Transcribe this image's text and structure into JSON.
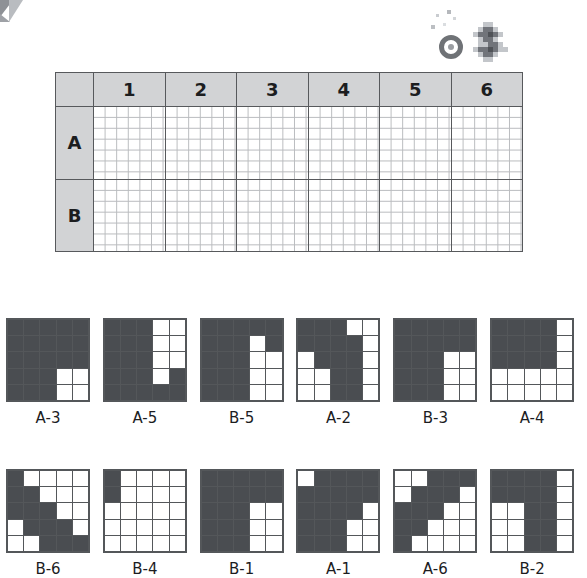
{
  "worksheet": {
    "column_headers": [
      "1",
      "2",
      "3",
      "4",
      "5",
      "6"
    ],
    "row_headers": [
      "A",
      "B"
    ],
    "header_fill": "#d2d3d5",
    "border_color": "#57595c",
    "inner_grid_color": "#b9bbbe"
  },
  "decor": {
    "corner_mark": "grey-wedge-mark",
    "ring_icon": "ring-ornament",
    "pixel_blob": "pixel-blob-ornament"
  },
  "patterns": {
    "on_color": "#4a4d51",
    "off_color": "#ffffff",
    "grid_size": 5,
    "legend": "1 = filled cell, 0 = empty cell",
    "rows": [
      [
        {
          "label": "A-3",
          "cells": [
            [
              1,
              1,
              1,
              1,
              1
            ],
            [
              1,
              1,
              1,
              1,
              1
            ],
            [
              1,
              1,
              1,
              1,
              1
            ],
            [
              1,
              1,
              1,
              0,
              0
            ],
            [
              1,
              1,
              1,
              0,
              0
            ]
          ]
        },
        {
          "label": "A-5",
          "cells": [
            [
              1,
              1,
              1,
              0,
              0
            ],
            [
              1,
              1,
              1,
              0,
              0
            ],
            [
              1,
              1,
              1,
              0,
              0
            ],
            [
              1,
              1,
              1,
              0,
              1
            ],
            [
              1,
              1,
              1,
              1,
              1
            ]
          ]
        },
        {
          "label": "B-5",
          "cells": [
            [
              1,
              1,
              1,
              1,
              1
            ],
            [
              1,
              1,
              1,
              0,
              1
            ],
            [
              1,
              1,
              1,
              0,
              0
            ],
            [
              1,
              1,
              1,
              0,
              0
            ],
            [
              1,
              1,
              1,
              0,
              0
            ]
          ]
        },
        {
          "label": "A-2",
          "cells": [
            [
              1,
              1,
              1,
              0,
              0
            ],
            [
              1,
              1,
              1,
              1,
              0
            ],
            [
              0,
              1,
              1,
              1,
              0
            ],
            [
              0,
              0,
              1,
              1,
              0
            ],
            [
              0,
              0,
              1,
              1,
              0
            ]
          ]
        },
        {
          "label": "B-3",
          "cells": [
            [
              1,
              1,
              1,
              1,
              1
            ],
            [
              1,
              1,
              1,
              1,
              1
            ],
            [
              1,
              1,
              1,
              0,
              0
            ],
            [
              1,
              1,
              1,
              0,
              0
            ],
            [
              1,
              1,
              1,
              0,
              0
            ]
          ]
        },
        {
          "label": "A-4",
          "cells": [
            [
              1,
              1,
              1,
              1,
              0
            ],
            [
              1,
              1,
              1,
              1,
              0
            ],
            [
              1,
              1,
              1,
              1,
              0
            ],
            [
              0,
              0,
              0,
              0,
              0
            ],
            [
              0,
              0,
              0,
              0,
              0
            ]
          ]
        }
      ],
      [
        {
          "label": "B-6",
          "cells": [
            [
              1,
              0,
              0,
              0,
              0
            ],
            [
              1,
              1,
              0,
              0,
              0
            ],
            [
              1,
              1,
              1,
              0,
              0
            ],
            [
              0,
              1,
              1,
              1,
              0
            ],
            [
              0,
              0,
              1,
              1,
              1
            ]
          ]
        },
        {
          "label": "B-4",
          "cells": [
            [
              1,
              0,
              0,
              0,
              0
            ],
            [
              1,
              0,
              0,
              0,
              0
            ],
            [
              0,
              0,
              0,
              0,
              0
            ],
            [
              0,
              0,
              0,
              0,
              0
            ],
            [
              0,
              0,
              0,
              0,
              0
            ]
          ]
        },
        {
          "label": "B-1",
          "cells": [
            [
              1,
              1,
              1,
              1,
              1
            ],
            [
              1,
              1,
              1,
              1,
              1
            ],
            [
              1,
              1,
              1,
              0,
              0
            ],
            [
              1,
              1,
              1,
              0,
              0
            ],
            [
              1,
              1,
              1,
              0,
              0
            ]
          ]
        },
        {
          "label": "A-1",
          "cells": [
            [
              0,
              1,
              1,
              1,
              1
            ],
            [
              1,
              1,
              1,
              1,
              1
            ],
            [
              1,
              1,
              1,
              1,
              0
            ],
            [
              1,
              1,
              1,
              0,
              0
            ],
            [
              1,
              1,
              1,
              0,
              0
            ]
          ]
        },
        {
          "label": "A-6",
          "cells": [
            [
              0,
              0,
              1,
              1,
              1
            ],
            [
              0,
              1,
              1,
              1,
              0
            ],
            [
              1,
              1,
              1,
              0,
              0
            ],
            [
              1,
              1,
              0,
              0,
              0
            ],
            [
              1,
              0,
              0,
              0,
              0
            ]
          ]
        },
        {
          "label": "B-2",
          "cells": [
            [
              1,
              1,
              1,
              1,
              0
            ],
            [
              1,
              1,
              1,
              1,
              0
            ],
            [
              0,
              0,
              1,
              1,
              0
            ],
            [
              0,
              0,
              1,
              1,
              0
            ],
            [
              0,
              0,
              1,
              1,
              0
            ]
          ]
        }
      ]
    ]
  }
}
